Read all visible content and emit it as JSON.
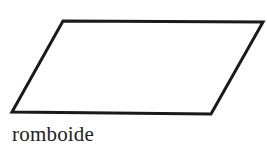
{
  "figure": {
    "shape": "parallelogram",
    "stroke_color": "#1a1a1a",
    "fill_color": "#ffffff",
    "stroke_width": 3,
    "vertices": [
      [
        63,
        21
      ],
      [
        263,
        22
      ],
      [
        211,
        114
      ],
      [
        12,
        112
      ]
    ],
    "label": "romboide"
  }
}
